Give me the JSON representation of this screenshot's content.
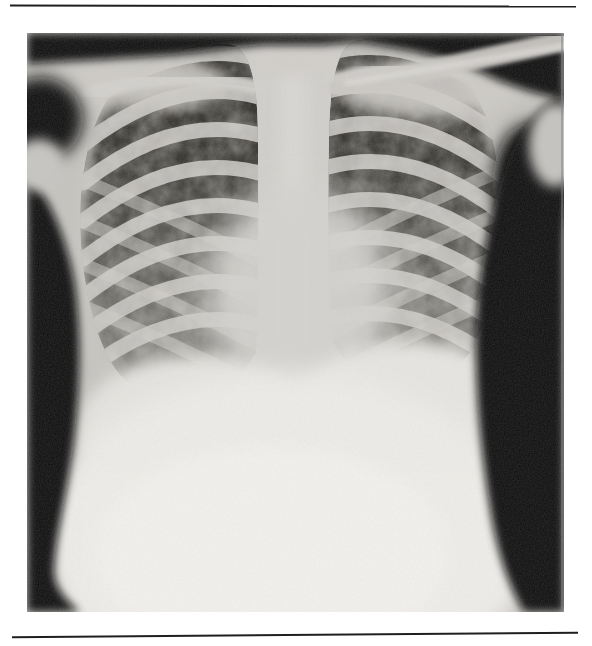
{
  "page": {
    "background_color": "#ffffff",
    "rule_color": "#1f1f1f"
  },
  "figure": {
    "kind": "chest-radiograph",
    "alt": "Frontal (anteroposterior) chest radiograph of a child: dark lung fields crossed by light rib bands in a checkered pattern, bright central mediastinum and heart, shoulders and arms at the top corners, black film background along the edges, and a large bright abdomen below the diaphragm.",
    "film": {
      "background_black": "#0a0a0a",
      "lung_field_dark": "#262420",
      "soft_tissue_gray": "#c6c4bf",
      "bone_bright": "#d2d0cc",
      "abdomen_bright": "#f0eeea"
    }
  },
  "css_vars": {
    "page-bg": "#ffffff",
    "rule": "#1f1f1f",
    "film-black": "#0a0a0a",
    "lung-dark": "#262420",
    "tissue": "#c6c4bf",
    "bone": "#d2d0cc",
    "bright": "#f0eeea"
  }
}
